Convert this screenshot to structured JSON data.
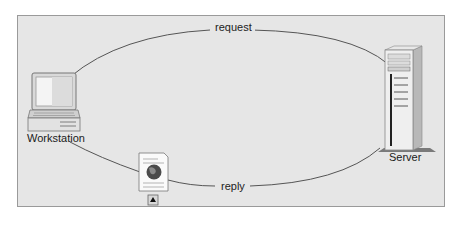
{
  "diagram": {
    "type": "client-server request/reply",
    "nodes": [
      {
        "id": "workstation",
        "label": "Workstation",
        "icon": "desktop-computer-icon"
      },
      {
        "id": "server",
        "label": "Server",
        "icon": "tower-server-icon"
      }
    ],
    "edges": [
      {
        "from": "workstation",
        "to": "server",
        "label": "request"
      },
      {
        "from": "server",
        "to": "workstation",
        "label": "reply",
        "attachment": "web-document-icon"
      }
    ],
    "colors": {
      "panel_background": "#e6e6e6",
      "panel_border": "#9a9a9a",
      "line": "#555555"
    }
  }
}
